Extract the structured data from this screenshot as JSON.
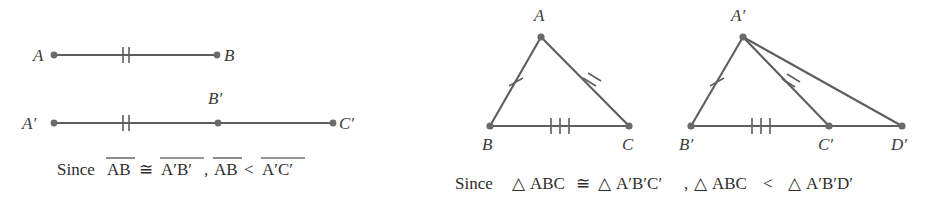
{
  "figure": {
    "background_color": "#ffffff",
    "line_color": "#5e5e5e",
    "text_color": "#2e2e2e",
    "dot_color": "#6a6a6a"
  },
  "left_panel": {
    "segment_ab": {
      "label_a": "A",
      "label_b": "B",
      "tick_count": 2,
      "endpoints": {
        "a": [
          54,
          55
        ],
        "b": [
          217,
          55
        ]
      }
    },
    "segment_abc": {
      "label_a": "A′",
      "label_b": "B′",
      "label_c": "C′",
      "tick_count": 2,
      "endpoints": {
        "a": [
          54,
          123
        ],
        "b": [
          218,
          123
        ],
        "c": [
          333,
          123
        ]
      }
    },
    "caption": {
      "since": "Since",
      "seg1": "AB",
      "relation1": "≅",
      "seg2": "A′B′",
      "comma": ",",
      "seg3": "AB",
      "relation2": "<",
      "seg4": "A′C′"
    }
  },
  "right_panel": {
    "triangle_abc": {
      "label_a": "A",
      "label_b": "B",
      "label_c": "C",
      "vertices": {
        "a": [
          541,
          37
        ],
        "b": [
          490,
          126
        ],
        "c": [
          629,
          126
        ]
      },
      "ticks": {
        "ab": 1,
        "ac": 2,
        "bc": 3
      }
    },
    "triangle_abcd": {
      "label_a": "A′",
      "label_b": "B′",
      "label_c": "C′",
      "label_d": "D′",
      "vertices": {
        "a": [
          743,
          37
        ],
        "b": [
          691,
          126
        ],
        "c": [
          829,
          126
        ],
        "d": [
          902,
          126
        ]
      },
      "ticks": {
        "ab": 1,
        "ac": 2,
        "bc": 3
      }
    },
    "caption": {
      "since": "Since",
      "tri_symbol": "△",
      "tri1": "ABC",
      "relation1": "≅",
      "tri2": "A′B′C′",
      "comma": ",",
      "tri3": "ABC",
      "relation2": "<",
      "tri4": "A′B′D′"
    }
  }
}
